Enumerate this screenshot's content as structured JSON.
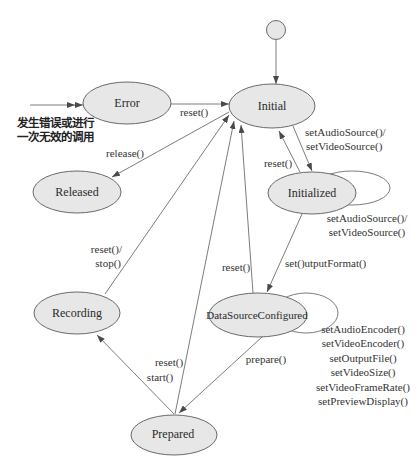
{
  "diagram": {
    "type": "state-machine",
    "states": {
      "start": "",
      "initial": "Initial",
      "error": "Error",
      "released": "Released",
      "initialized": "Initialized",
      "data_source_configured": "DataSourceConfigured",
      "recording": "Recording",
      "prepared": "Prepared"
    },
    "transitions": [
      {
        "from": "start",
        "to": "Initial",
        "label": []
      },
      {
        "from": "external",
        "to": "Error",
        "label": []
      },
      {
        "from": "Error",
        "to": "Initial",
        "label": [
          "reset()"
        ]
      },
      {
        "from": "Initial",
        "to": "Released",
        "label": [
          "release()"
        ]
      },
      {
        "from": "Recording",
        "to": "Initial",
        "label": [
          "reset()/",
          "stop()"
        ]
      },
      {
        "from": "Prepared",
        "to": "Initial",
        "label": [
          "reset()"
        ]
      },
      {
        "from": "DataSourceConfigured",
        "to": "Initial",
        "label": [
          "reset()"
        ]
      },
      {
        "from": "Initial",
        "to": "Initialized",
        "label": [
          "setAudioSource()/",
          "setVideoSource()"
        ]
      },
      {
        "from": "Initialized",
        "to": "Initial",
        "label": [
          "reset()"
        ]
      },
      {
        "from": "Initialized",
        "to": "Initialized",
        "label": [
          "setAudioSource()/",
          "setVideoSource()"
        ]
      },
      {
        "from": "Initialized",
        "to": "DataSourceConfigured",
        "label": [
          "set()utputFormat()"
        ]
      },
      {
        "from": "DataSourceConfigured",
        "to": "DataSourceConfigured",
        "label": [
          "setAudioEncoder()",
          "setVideoEncoder()",
          "setOutputFile()",
          "setVideoSize()",
          "setVideoFrameRate()",
          "setPreviewDisplay()"
        ]
      },
      {
        "from": "DataSourceConfigured",
        "to": "Prepared",
        "label": [
          "prepare()"
        ]
      },
      {
        "from": "Prepared",
        "to": "Recording",
        "label": [
          "start()"
        ]
      }
    ]
  },
  "annotation": {
    "lines": [
      "发生错误或进行",
      "一次无效的调用"
    ]
  },
  "colors": {
    "state_fill": "#e7e7e7",
    "stroke": "#5a5a5a",
    "text": "#2a2a2a"
  }
}
